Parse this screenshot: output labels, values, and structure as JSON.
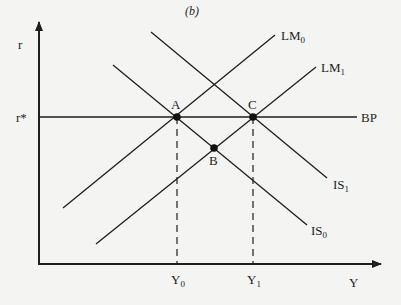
{
  "diagram": {
    "panel_label": "(b)",
    "colors": {
      "background": "#f4f4f3",
      "ink": "#1e1e1e"
    },
    "axes": {
      "y_label": "r",
      "x_label": "Y",
      "origin": [
        39,
        264
      ],
      "y_tip": [
        39,
        20
      ],
      "x_tip": [
        382,
        265
      ]
    },
    "reference": {
      "r_star_label": "r*",
      "y0_label": "Y",
      "y0_sub": "0",
      "y1_label": "Y",
      "y1_sub": "1"
    },
    "curves": [
      {
        "id": "LM0",
        "label": "LM",
        "sub": "0",
        "from": [
          63,
          208
        ],
        "to": [
          275,
          35
        ]
      },
      {
        "id": "LM1",
        "label": "LM",
        "sub": "1",
        "from": [
          96,
          244
        ],
        "to": [
          316,
          67
        ]
      },
      {
        "id": "IS0",
        "label": "IS",
        "sub": "0",
        "from": [
          113,
          65
        ],
        "to": [
          307,
          225
        ]
      },
      {
        "id": "IS1",
        "label": "IS",
        "sub": "1",
        "from": [
          151,
          32
        ],
        "to": [
          327,
          178
        ]
      },
      {
        "id": "BP",
        "label": "BP",
        "sub": "",
        "from": [
          39,
          117
        ],
        "to": [
          357,
          117
        ]
      }
    ],
    "points": [
      {
        "id": "A",
        "label": "A",
        "pos": [
          177,
          117
        ]
      },
      {
        "id": "B",
        "label": "B",
        "pos": [
          214,
          148
        ]
      },
      {
        "id": "C",
        "label": "C",
        "pos": [
          253,
          117
        ]
      }
    ]
  }
}
